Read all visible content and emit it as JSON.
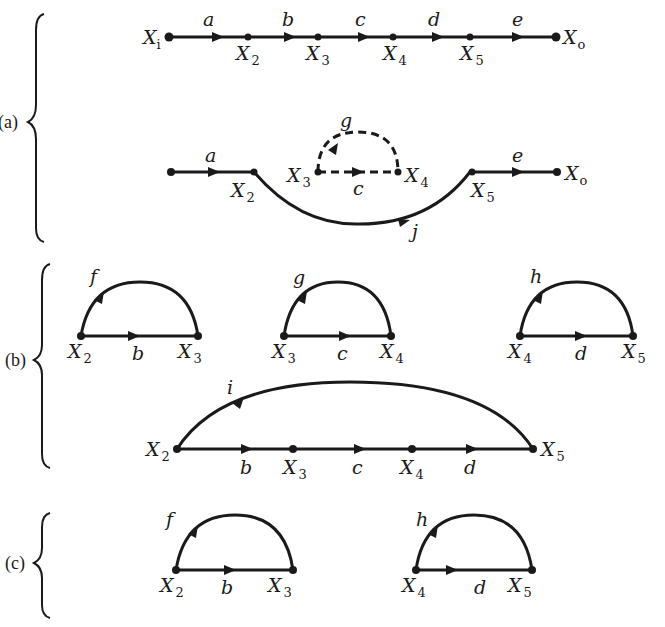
{
  "figure": {
    "parts": [
      {
        "id": "a",
        "label": "(a)"
      },
      {
        "id": "b",
        "label": "(b)"
      },
      {
        "id": "c",
        "label": "(c)"
      }
    ],
    "nodes": {
      "Xi": {
        "base": "X",
        "sub": "i"
      },
      "X2": {
        "base": "X",
        "sub": "2"
      },
      "X3": {
        "base": "X",
        "sub": "3"
      },
      "X4": {
        "base": "X",
        "sub": "4"
      },
      "X5": {
        "base": "X",
        "sub": "5"
      },
      "Xo": {
        "base": "X",
        "sub": "o"
      }
    },
    "edge_labels": {
      "a": "a",
      "b": "b",
      "c": "c",
      "d": "d",
      "e": "e",
      "f": "f",
      "g": "g",
      "h": "h",
      "i": "i",
      "j": "j"
    },
    "part_a": {
      "top_chain": {
        "nodes": [
          "Xi",
          "X2",
          "X3",
          "X4",
          "X5",
          "Xo"
        ],
        "edges": [
          {
            "from": "Xi",
            "to": "X2",
            "label": "a"
          },
          {
            "from": "X2",
            "to": "X3",
            "label": "b"
          },
          {
            "from": "X3",
            "to": "X4",
            "label": "c"
          },
          {
            "from": "X4",
            "to": "X5",
            "label": "d"
          },
          {
            "from": "X5",
            "to": "Xo",
            "label": "e"
          }
        ]
      },
      "reduced_graph": {
        "edges": [
          {
            "from": "start",
            "to": "X2",
            "label": "a",
            "style": "solid"
          },
          {
            "from": "X3",
            "to": "X4",
            "label": "c",
            "style": "dashed"
          },
          {
            "from": "X4",
            "to": "X3",
            "label": "g",
            "style": "dashed",
            "shape": "loop"
          },
          {
            "from": "X2",
            "to": "X5",
            "label": "j",
            "style": "solid",
            "shape": "curve-below"
          },
          {
            "from": "X5",
            "to": "Xo",
            "label": "e",
            "style": "solid"
          }
        ]
      }
    },
    "part_b": {
      "loops": [
        {
          "forward": {
            "from": "X2",
            "to": "X3",
            "label": "b"
          },
          "feedback": {
            "from": "X3",
            "to": "X2",
            "label": "f"
          }
        },
        {
          "forward": {
            "from": "X3",
            "to": "X4",
            "label": "c"
          },
          "feedback": {
            "from": "X4",
            "to": "X3",
            "label": "g"
          }
        },
        {
          "forward": {
            "from": "X4",
            "to": "X5",
            "label": "d"
          },
          "feedback": {
            "from": "X5",
            "to": "X4",
            "label": "h"
          }
        },
        {
          "forward_path": [
            "X2",
            "X3",
            "X4",
            "X5"
          ],
          "forward_labels": [
            "b",
            "c",
            "d"
          ],
          "feedback": {
            "from": "X5",
            "to": "X2",
            "label": "i"
          }
        }
      ]
    },
    "part_c": {
      "loops": [
        {
          "forward": {
            "from": "X2",
            "to": "X3",
            "label": "b"
          },
          "feedback": {
            "from": "X3",
            "to": "X2",
            "label": "f"
          }
        },
        {
          "forward": {
            "from": "X4",
            "to": "X5",
            "label": "d"
          },
          "feedback": {
            "from": "X5",
            "to": "X4",
            "label": "h"
          }
        }
      ]
    }
  }
}
